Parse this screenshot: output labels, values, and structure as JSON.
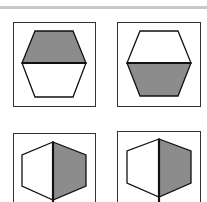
{
  "figure": {
    "colors": {
      "fill": "#8c8c8c",
      "stroke": "#111111",
      "box": "#333333",
      "background": "#ffffff"
    },
    "panels": [
      {
        "id": "top-left",
        "shape": "hexagon",
        "split": "horizontal",
        "shaded_half": "top"
      },
      {
        "id": "top-right",
        "shape": "hexagon",
        "split": "horizontal",
        "shaded_half": "bottom"
      },
      {
        "id": "bottom-left",
        "shape": "hexagon",
        "split": "vertical",
        "shaded_half": "right"
      },
      {
        "id": "bottom-right",
        "shape": "hexagon",
        "split": "vertical",
        "shaded_half": "right"
      }
    ]
  }
}
